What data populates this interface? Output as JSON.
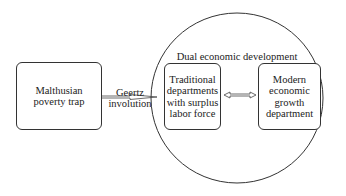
{
  "diagram": {
    "type": "flow",
    "nodes": {
      "malthusian": {
        "label": "Malthusian\npoverty trap"
      },
      "traditional": {
        "label": "Traditional\ndepartments\nwith surplus\nlabor force"
      },
      "modern": {
        "label": "Modern\neconomic\ngrowth\ndepartment"
      }
    },
    "container": {
      "label": "Dual economic development",
      "shape": "circle"
    },
    "edges": [
      {
        "from": "malthusian",
        "to": "traditional",
        "label": "Geertz\ninvolution",
        "style": "single-arrow"
      },
      {
        "from": "traditional",
        "to": "modern",
        "label": "",
        "style": "double-arrow"
      }
    ],
    "colors": {
      "stroke": "#333333",
      "background": "#ffffff",
      "text": "#222222"
    }
  }
}
